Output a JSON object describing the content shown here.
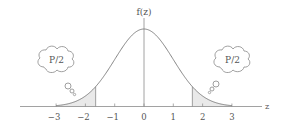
{
  "diagram": {
    "y_axis_label": "f(z)",
    "x_axis_label": "z",
    "x_ticks": [
      "-3",
      "-2",
      "-1",
      "0",
      "1",
      "2",
      "3"
    ],
    "left_tail_label": "P/2",
    "right_tail_label": "P/2",
    "critical_value": 1.65,
    "colors": {
      "curve": "#777777",
      "axis": "#888888",
      "shade": "#e6e6e6",
      "text": "#555555"
    }
  }
}
